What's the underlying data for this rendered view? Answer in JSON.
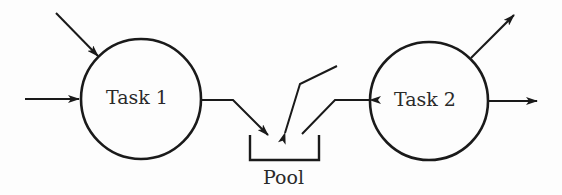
{
  "diagram": {
    "nodes": [
      {
        "id": "task1",
        "label": "Task 1",
        "shape": "circle"
      },
      {
        "id": "task2",
        "label": "Task 2",
        "shape": "circle"
      },
      {
        "id": "pool",
        "label": "Pool",
        "shape": "open-container"
      }
    ],
    "edges": [
      {
        "from": "external",
        "to": "task1",
        "desc": "incoming from upper-left"
      },
      {
        "from": "external",
        "to": "task1",
        "desc": "incoming from left"
      },
      {
        "from": "task1",
        "to": "pool"
      },
      {
        "from": "pool",
        "to": "external",
        "desc": "outgoing upward"
      },
      {
        "from": "task2",
        "to": "pool"
      },
      {
        "from": "task2",
        "to": "external",
        "desc": "outgoing upper-right"
      },
      {
        "from": "task2",
        "to": "external",
        "desc": "outgoing right"
      }
    ],
    "stroke_color": "#1a1a1a"
  }
}
